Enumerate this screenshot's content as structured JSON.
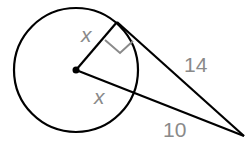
{
  "diagram": {
    "type": "geometry-circle-tangent",
    "labels": {
      "radius_to_tangent": "x",
      "radius_on_secant": "x",
      "tangent_length": "14",
      "external_secant_length": "10"
    },
    "colors": {
      "stroke": "#000000",
      "label": "#8a8a8a",
      "right_angle_mark": "#8a8a8a"
    },
    "geometry": {
      "center": [
        76,
        70
      ],
      "radius": 62,
      "tangent_point": [
        117,
        22
      ],
      "external_point": [
        244,
        136
      ]
    }
  }
}
